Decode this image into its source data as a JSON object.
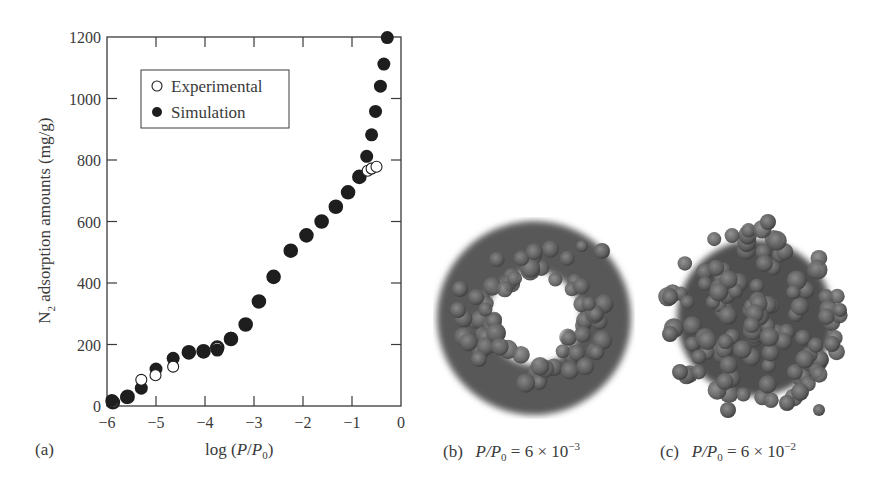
{
  "chart_data": {
    "type": "scatter",
    "title": "",
    "xlabel": "log (P/P0)",
    "ylabel": "N2 adsorption amounts (mg/g)",
    "xlim": [
      -6,
      0
    ],
    "ylim": [
      0,
      1200
    ],
    "xticks": [
      -6,
      -5,
      -4,
      -3,
      -2,
      -1,
      0
    ],
    "yticks": [
      0,
      200,
      400,
      600,
      800,
      1000,
      1200
    ],
    "grid": false,
    "legend_position": "upper-left (inset box)",
    "series": [
      {
        "name": "Experimental",
        "marker": "open-circle",
        "x": [
          -5.88,
          -5.58,
          -5.3,
          -5.01,
          -4.65,
          -4.33,
          -4.03,
          -3.75,
          -3.47,
          -3.17,
          -2.9,
          -2.6,
          -2.25,
          -1.93,
          -1.62,
          -1.33,
          -1.08,
          -0.85,
          -0.68,
          -0.6,
          -0.5
        ],
        "y": [
          12,
          30,
          85,
          100,
          128,
          175,
          178,
          190,
          218,
          265,
          340,
          420,
          505,
          555,
          600,
          648,
          695,
          745,
          765,
          772,
          778
        ]
      },
      {
        "name": "Simulation",
        "marker": "filled-circle",
        "x": [
          -5.9,
          -5.6,
          -5.3,
          -5.0,
          -4.65,
          -4.33,
          -4.03,
          -3.75,
          -3.47,
          -3.17,
          -2.9,
          -2.6,
          -2.25,
          -1.93,
          -1.62,
          -1.33,
          -1.08,
          -0.85,
          -0.7,
          -0.6,
          -0.52,
          -0.42,
          -0.35,
          -0.28
        ],
        "y": [
          18,
          28,
          58,
          120,
          155,
          172,
          176,
          182,
          220,
          265,
          340,
          420,
          505,
          555,
          600,
          648,
          695,
          745,
          812,
          882,
          958,
          1040,
          1112,
          1198
        ]
      }
    ]
  },
  "panels": {
    "a": {
      "label": "(a)"
    },
    "b": {
      "label": "(b)",
      "caption_lhs": "P/P",
      "sub": "0",
      "caption_rhs": " = 6 × 10",
      "exp": "−3"
    },
    "c": {
      "label": "(c)",
      "caption_lhs": "P/P",
      "sub": "0",
      "caption_rhs": " = 6 × 10",
      "exp": "−2"
    }
  },
  "legend": {
    "items": [
      {
        "label": "Experimental",
        "marker": "open"
      },
      {
        "label": "Simulation",
        "marker": "filled"
      }
    ]
  },
  "axes": {
    "xlabel_pre": "log (",
    "xlabel_P": "P",
    "xlabel_slash": "/",
    "xlabel_P0": "P",
    "xlabel_sub": "0",
    "xlabel_post": ")",
    "ylabel_N": "N",
    "ylabel_sub": "2",
    "ylabel_rest": " adsorption amounts (mg/g)"
  },
  "colors": {
    "axis": "#3a3a3a",
    "marker": "#1e1e1e",
    "molecule": "#5a5a5a",
    "molecule_dark": "#3e3e3e"
  }
}
